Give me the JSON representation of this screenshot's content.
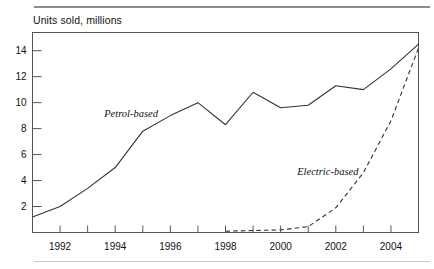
{
  "figure": {
    "title": "Units sold, millions",
    "top_rule_color": "#8c8c8c",
    "bottom_rule_color": "#c9c9c9",
    "axis_color": "#555555",
    "line_color": "#333333"
  },
  "chart_data": {
    "type": "line",
    "title": "Units sold, millions",
    "xlabel": "",
    "ylabel": "Units sold, millions",
    "xlim": [
      1991,
      2005
    ],
    "ylim": [
      0,
      15.4
    ],
    "grid": false,
    "legend": "inline-annotations",
    "x": [
      1991,
      1992,
      1993,
      1994,
      1995,
      1996,
      1997,
      1998,
      1999,
      2000,
      2001,
      2002,
      2003,
      2004,
      2005
    ],
    "xticks": [
      1992,
      1994,
      1996,
      1998,
      2000,
      2002,
      2004
    ],
    "xticklabels": [
      "1992",
      "1994",
      "1996",
      "1998",
      "2000",
      "2002",
      "2004"
    ],
    "xticks_minor": [
      1991,
      1993,
      1995,
      1997,
      1999,
      2001,
      2003,
      2005
    ],
    "yticks": [
      2,
      4,
      6,
      8,
      10,
      12,
      14
    ],
    "yticklabels": [
      "2",
      "4",
      "6",
      "8",
      "10",
      "12",
      "14"
    ],
    "series": [
      {
        "name": "Petrol-based",
        "style": "solid",
        "label_x": 1993.6,
        "label_y": 8.9,
        "values": [
          1.2,
          2.0,
          3.4,
          5.0,
          7.8,
          9.0,
          10.0,
          8.3,
          10.8,
          9.6,
          9.8,
          11.3,
          11.0,
          12.6,
          14.5
        ]
      },
      {
        "name": "Electric-based",
        "style": "dashed",
        "label_x": 2000.6,
        "label_y": 4.4,
        "values": [
          null,
          null,
          null,
          null,
          null,
          null,
          null,
          0.1,
          0.15,
          0.2,
          0.45,
          1.9,
          4.6,
          8.6,
          14.2
        ]
      }
    ]
  }
}
